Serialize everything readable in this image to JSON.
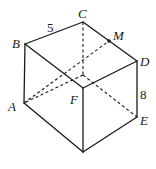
{
  "figure": {
    "type": "cube",
    "stroke_color": "#1a1a1a",
    "vertices": {
      "B": {
        "label": "B"
      },
      "C": {
        "label": "C"
      },
      "D": {
        "label": "D"
      },
      "M": {
        "label": "M"
      },
      "A": {
        "label": "A"
      },
      "F": {
        "label": "F"
      },
      "E": {
        "label": "E"
      }
    },
    "measurements": {
      "BC": "5",
      "DE": "8"
    }
  }
}
